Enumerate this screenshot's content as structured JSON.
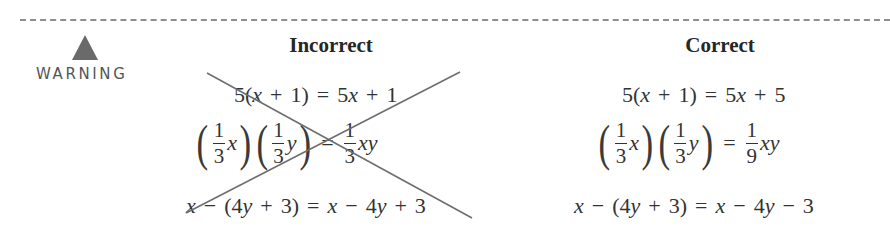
{
  "warning": {
    "icon": "warning-triangle-icon",
    "label": "WARNING",
    "icon_color": "#6a6a6a"
  },
  "columns": {
    "incorrect": {
      "heading": "Incorrect",
      "crossed_out": true,
      "equations": [
        {
          "lhs": "5(x + 1)",
          "rhs": "5x + 1",
          "parts": {
            "a": "5(",
            "x": "x",
            "b": "+",
            "c": "1)",
            "eq": "=",
            "d": "5",
            "dx": "x",
            "e": "+",
            "f": "1"
          }
        },
        {
          "lhs": "(1/3 x)(1/3 y)",
          "rhs": "1/3 xy",
          "parts": {
            "n1": "1",
            "d1": "3",
            "v1": "x",
            "n2": "1",
            "d2": "3",
            "v2": "y",
            "eq": "=",
            "n3": "1",
            "d3": "3",
            "v3": "xy",
            "lp": "(",
            "rp": ")"
          }
        },
        {
          "lhs": "x − (4y + 3)",
          "rhs": "x − 4y + 3",
          "parts": {
            "x": "x",
            "m": "−",
            "lp": "(4",
            "y": "y",
            "p": "+",
            "c": "3)",
            "eq": "=",
            "x2": "x",
            "m2": "−",
            "four": "4",
            "y2": "y",
            "op": "+",
            "three": "3"
          }
        }
      ]
    },
    "correct": {
      "heading": "Correct",
      "crossed_out": false,
      "equations": [
        {
          "lhs": "5(x + 1)",
          "rhs": "5x + 5",
          "parts": {
            "a": "5(",
            "x": "x",
            "b": "+",
            "c": "1)",
            "eq": "=",
            "d": "5",
            "dx": "x",
            "e": "+",
            "f": "5"
          }
        },
        {
          "lhs": "(1/3 x)(1/3 y)",
          "rhs": "1/9 xy",
          "parts": {
            "n1": "1",
            "d1": "3",
            "v1": "x",
            "n2": "1",
            "d2": "3",
            "v2": "y",
            "eq": "=",
            "n3": "1",
            "d3": "9",
            "v3": "xy",
            "lp": "(",
            "rp": ")"
          }
        },
        {
          "lhs": "x − (4y + 3)",
          "rhs": "x − 4y − 3",
          "parts": {
            "x": "x",
            "m": "−",
            "lp": "(4",
            "y": "y",
            "p": "+",
            "c": "3)",
            "eq": "=",
            "x2": "x",
            "m2": "−",
            "four": "4",
            "y2": "y",
            "op": "−",
            "three": "3"
          }
        }
      ]
    }
  },
  "cross_mark": {
    "color": "#6e6e6e",
    "line_a": [
      207,
      73,
      472,
      218
    ],
    "line_b": [
      186,
      213,
      460,
      72
    ]
  }
}
